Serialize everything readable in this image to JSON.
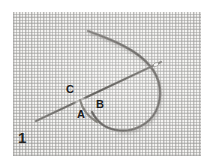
{
  "figure": {
    "number": "1",
    "caption_text": "1",
    "background_color": "#f4f3f1",
    "thread_color": "#8f8d8a",
    "needle_color": "#7d7b78",
    "label_color": "#1d1d1d"
  },
  "labels": [
    {
      "id": "C",
      "text": "C",
      "x": 66,
      "y": 84
    },
    {
      "id": "B",
      "text": "B",
      "x": 96,
      "y": 99
    },
    {
      "id": "A",
      "text": "A",
      "x": 77,
      "y": 109
    }
  ],
  "elements": {
    "fabric_name": "woven-canvas-fabric",
    "thread_loop_name": "thread-loop",
    "needle_name": "sewing-needle",
    "figure_number_name": "figure-number"
  }
}
